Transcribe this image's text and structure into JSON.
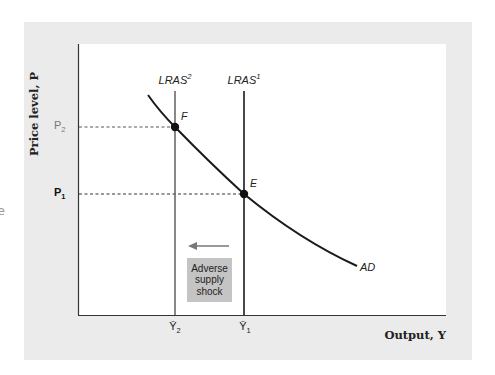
{
  "figure": {
    "axes": {
      "y_label": "Price level, P",
      "x_label": "Output, Y"
    },
    "price_ticks": [
      {
        "id": "P2",
        "base": "P",
        "sub": "2"
      },
      {
        "id": "P1",
        "base": "P",
        "sub": "1"
      }
    ],
    "output_ticks": [
      {
        "id": "Ybar2",
        "base": "Ȳ",
        "sub": "2"
      },
      {
        "id": "Ybar1",
        "base": "Ȳ",
        "sub": "1"
      }
    ],
    "curves": {
      "lras2": {
        "base": "LRAS",
        "sup": "2"
      },
      "lras1": {
        "base": "LRAS",
        "sup": "1"
      },
      "ad": "AD"
    },
    "points": {
      "f": "F",
      "e": "E"
    },
    "annotation": {
      "lines": [
        "Adverse",
        "supply",
        "shock"
      ],
      "arrow_direction": "left"
    },
    "edge_fragment": "e",
    "colors": {
      "panel_bg": "#ebebeb",
      "plot_bg": "#ffffff",
      "line": "#1a1a1a",
      "lras2_line": "#555555",
      "annotation_box": "#c4c4c4",
      "arrow": "#777777"
    }
  }
}
